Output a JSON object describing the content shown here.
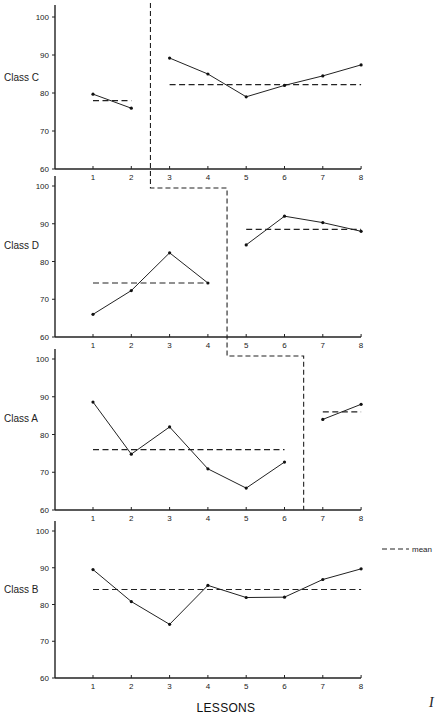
{
  "chart_data": {
    "type": "line",
    "title": "",
    "xlabel": "LESSONS",
    "ylabel": "",
    "x": [
      1,
      2,
      3,
      4,
      5,
      6,
      7,
      8
    ],
    "ylim": [
      60,
      100
    ],
    "yticks": [
      60,
      70,
      80,
      90,
      100
    ],
    "grid": false,
    "legend": {
      "position": "right",
      "entries": [
        {
          "label": "mean",
          "style": "dashed"
        }
      ]
    },
    "figure_mark": "I",
    "panels": [
      {
        "name": "Class C",
        "series": [
          {
            "name": "phase 1",
            "x": [
              1,
              2
            ],
            "values": [
              79.7,
              76.0
            ],
            "mean": 78.0
          },
          {
            "name": "phase 2",
            "x": [
              3,
              4,
              5,
              6,
              7,
              8
            ],
            "values": [
              89.2,
              85.0,
              79.0,
              82.0,
              84.5,
              87.4
            ],
            "mean": 82.2
          }
        ],
        "phase_change_after": 2.5
      },
      {
        "name": "Class D",
        "series": [
          {
            "name": "phase 1",
            "x": [
              1,
              2,
              3,
              4
            ],
            "values": [
              66.0,
              72.3,
              82.3,
              74.3
            ],
            "mean": 74.3
          },
          {
            "name": "phase 2",
            "x": [
              5,
              6,
              7,
              8
            ],
            "values": [
              84.4,
              92.0,
              90.3,
              88.0
            ],
            "mean": 88.5
          }
        ],
        "phase_change_after": 4.5
      },
      {
        "name": "Class A",
        "series": [
          {
            "name": "phase 1",
            "x": [
              1,
              2,
              3,
              4,
              5,
              6
            ],
            "values": [
              88.6,
              74.8,
              82.0,
              70.9,
              65.8,
              72.7
            ],
            "mean": 76.0
          },
          {
            "name": "phase 2",
            "x": [
              7,
              8
            ],
            "values": [
              84.0,
              88.0
            ],
            "mean": 86.0
          }
        ],
        "phase_change_after": 6.5
      },
      {
        "name": "Class B",
        "series": [
          {
            "name": "all lessons",
            "x": [
              1,
              2,
              3,
              4,
              5,
              6,
              7,
              8
            ],
            "values": [
              89.5,
              80.8,
              74.6,
              85.2,
              81.9,
              82.0,
              86.8,
              89.7
            ],
            "mean": 84.1
          }
        ],
        "phase_change_after": null
      }
    ]
  },
  "labels": {
    "xlabel": "LESSONS",
    "legend_mean": "mean",
    "figure_mark": "I"
  }
}
